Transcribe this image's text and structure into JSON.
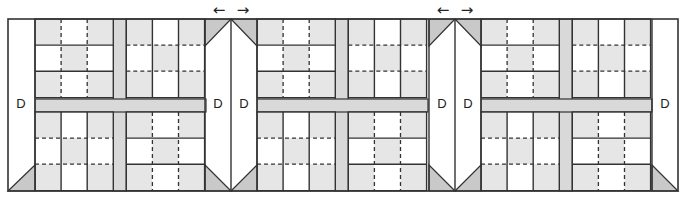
{
  "diagram": {
    "block_count": 3,
    "d_label": "D",
    "arrows": [
      {
        "name": "join-arrows-1",
        "left": "←",
        "right": "→"
      },
      {
        "name": "join-arrows-2",
        "left": "←",
        "right": "→"
      }
    ],
    "colors": {
      "light_gray": "#e6e6e6",
      "sashing": "#d9d9d9",
      "triangle": "#c9c9c9",
      "line": "#333333",
      "white": "#ffffff"
    },
    "quadrants": {
      "top_left": {
        "pattern": [
          [
            "g",
            "w",
            "g"
          ],
          [
            "w",
            "g",
            "w"
          ],
          [
            "g",
            "w",
            "g"
          ]
        ],
        "inner_vertical": "dashed",
        "inner_horizontal": "solid"
      },
      "top_right": {
        "pattern": [
          [
            "g",
            "w",
            "g"
          ],
          [
            "w",
            "g",
            "w"
          ],
          [
            "g",
            "w",
            "g"
          ]
        ],
        "inner_vertical": "solid",
        "inner_horizontal": "dashed"
      },
      "bottom_left": {
        "pattern": [
          [
            "g",
            "w",
            "g"
          ],
          [
            "w",
            "g",
            "w"
          ],
          [
            "g",
            "w",
            "g"
          ]
        ],
        "inner_vertical": "solid",
        "inner_horizontal": "dashed"
      },
      "bottom_right": {
        "pattern": [
          [
            "g",
            "w",
            "g"
          ],
          [
            "w",
            "g",
            "w"
          ],
          [
            "g",
            "w",
            "g"
          ]
        ],
        "inner_vertical": "dashed",
        "inner_horizontal": "solid"
      }
    }
  }
}
